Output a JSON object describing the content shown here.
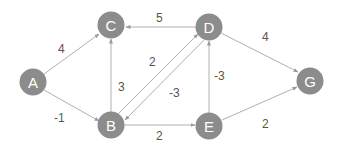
{
  "graph": {
    "nodes": [
      {
        "id": "A",
        "label": "A",
        "x": 33,
        "y": 82
      },
      {
        "id": "C",
        "label": "C",
        "x": 111,
        "y": 25
      },
      {
        "id": "B",
        "label": "B",
        "x": 111,
        "y": 125
      },
      {
        "id": "D",
        "label": "D",
        "x": 209,
        "y": 27
      },
      {
        "id": "E",
        "label": "E",
        "x": 209,
        "y": 126
      },
      {
        "id": "G",
        "label": "G",
        "x": 310,
        "y": 81
      }
    ],
    "edges": [
      {
        "from": "A",
        "to": "C",
        "weight": "4"
      },
      {
        "from": "A",
        "to": "B",
        "weight": "-1"
      },
      {
        "from": "B",
        "to": "C",
        "weight": "3"
      },
      {
        "from": "B",
        "to": "D",
        "weight": "2"
      },
      {
        "from": "D",
        "to": "B",
        "weight": "-3"
      },
      {
        "from": "D",
        "to": "C",
        "weight": "5"
      },
      {
        "from": "E",
        "to": "D",
        "weight": "-3"
      },
      {
        "from": "B",
        "to": "E",
        "weight": "2"
      },
      {
        "from": "D",
        "to": "G",
        "weight": "4"
      },
      {
        "from": "E",
        "to": "G",
        "weight": "2"
      }
    ]
  },
  "colors": {
    "node": "#8c8c8c",
    "edge": "#b0b0b0",
    "label": "#555555"
  }
}
